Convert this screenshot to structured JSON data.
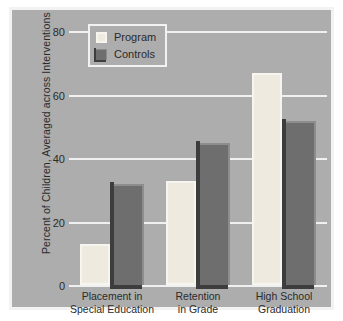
{
  "chart_data": {
    "type": "bar",
    "title": "",
    "xlabel": "",
    "ylabel": "Percent of Children, Averaged across Interventions",
    "ylim": [
      0,
      80
    ],
    "yticks": [
      0,
      20,
      40,
      60,
      80
    ],
    "ytick_labels": [
      "0",
      "20",
      "40",
      "60",
      "80"
    ],
    "grid": true,
    "legend_position": "top-left",
    "categories": [
      "Placement in\nSpecial Education",
      "Retention\nin Grade",
      "High School\nGraduation"
    ],
    "category_lines": [
      [
        "Placement in",
        "Special Education"
      ],
      [
        "Retention",
        "in Grade"
      ],
      [
        "High School",
        "Graduation"
      ]
    ],
    "series": [
      {
        "name": "Program",
        "color": "#eeeae0",
        "values": [
          13,
          33,
          67
        ]
      },
      {
        "name": "Controls",
        "color": "#6e6e6e",
        "values": [
          32,
          45,
          52
        ]
      }
    ],
    "colors": {
      "background": "#adadad",
      "frame": "#f2f2f2",
      "gridline": "#f0f0f0",
      "text": "#2b2b2b",
      "program": "#eeeae0",
      "controls": "#6e6e6e",
      "controls_shadow": "#3d3d3d"
    }
  }
}
